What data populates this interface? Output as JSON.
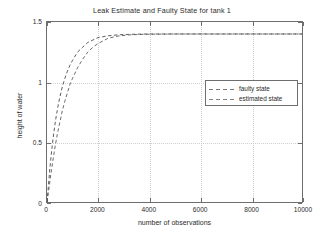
{
  "chart_data": {
    "type": "line",
    "title": "Leak Estimate and Faulty State for tank 1",
    "xlabel": "number of observations",
    "ylabel": "height of water",
    "xlim": [
      0,
      10000
    ],
    "ylim": [
      0,
      1.5
    ],
    "xticks": [
      0,
      2000,
      4000,
      6000,
      8000,
      10000
    ],
    "xtick_labels": [
      "0",
      "2000",
      "4000",
      "6000",
      "8000",
      "10000"
    ],
    "yticks": [
      0,
      0.5,
      1,
      1.5
    ],
    "ytick_labels": [
      "0",
      "0.5",
      "1",
      "1.5"
    ],
    "grid": true,
    "legend_position": "upper right",
    "series": [
      {
        "name": "faulty state",
        "color": "#4a4a4a",
        "linestyle": "dashed",
        "plateau": 1.4,
        "x": [
          0,
          50,
          100,
          150,
          200,
          250,
          300,
          350,
          400,
          450,
          500,
          600,
          700,
          800,
          900,
          1000,
          1200,
          1400,
          1600,
          1800,
          2000,
          2400,
          2800,
          3200,
          3600,
          4000,
          5000,
          6000,
          7000,
          8000,
          9000,
          10000
        ],
        "values": [
          0,
          0.12,
          0.25,
          0.36,
          0.46,
          0.55,
          0.63,
          0.7,
          0.76,
          0.82,
          0.87,
          0.96,
          1.03,
          1.09,
          1.14,
          1.18,
          1.25,
          1.29,
          1.33,
          1.35,
          1.37,
          1.385,
          1.393,
          1.397,
          1.399,
          1.4,
          1.4,
          1.4,
          1.4,
          1.4,
          1.4,
          1.4
        ]
      },
      {
        "name": "estimated state",
        "color": "#5a5a5a",
        "linestyle": "dashed",
        "plateau": 1.4,
        "x": [
          0,
          50,
          100,
          150,
          200,
          250,
          300,
          350,
          400,
          450,
          500,
          600,
          700,
          800,
          900,
          1000,
          1200,
          1400,
          1600,
          1800,
          2000,
          2400,
          2800,
          3200,
          3600,
          4000,
          5000,
          6000,
          7000,
          8000,
          9000,
          10000
        ],
        "values": [
          0,
          0.07,
          0.15,
          0.23,
          0.3,
          0.37,
          0.44,
          0.5,
          0.56,
          0.61,
          0.66,
          0.76,
          0.84,
          0.91,
          0.98,
          1.03,
          1.12,
          1.19,
          1.25,
          1.29,
          1.32,
          1.365,
          1.383,
          1.392,
          1.396,
          1.398,
          1.4,
          1.4,
          1.4,
          1.4,
          1.4,
          1.4
        ]
      }
    ]
  },
  "legend": {
    "items": [
      {
        "label": "faulty state"
      },
      {
        "label": "estimated state"
      }
    ]
  },
  "colors": {
    "axis": "#6e6e6e",
    "grid": "#cfcfcf",
    "text": "#2b2b2b",
    "background": "#ffffff"
  }
}
